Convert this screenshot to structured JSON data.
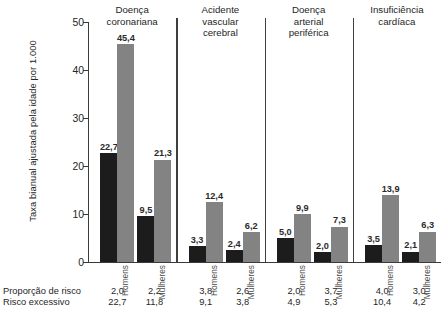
{
  "chart_data": {
    "type": "bar",
    "title": "",
    "xlabel": "",
    "ylabel": "Taxa bianual ajustada pela idade por 1.000",
    "ylim": [
      0,
      50
    ],
    "yticks": [
      0,
      10,
      20,
      30,
      40,
      50
    ],
    "ytick_labels": [
      "0",
      "10",
      "20",
      "30",
      "40",
      "50"
    ],
    "grid": false,
    "legend_position": "none",
    "group_titles": [
      "Doença\ncoronariana",
      "Acidente\nvascular\ncerebral",
      "Doença\narterial\nperiférica",
      "Insuficiência\ncardíaca"
    ],
    "categories": [
      "Homens",
      "Mulheres",
      "Homens",
      "Mulheres",
      "Homens",
      "Mulheres",
      "Homens",
      "Mulheres"
    ],
    "series": [
      {
        "name": "dark",
        "color": "#1c1c1c",
        "values": [
          22.7,
          9.5,
          3.3,
          2.4,
          5.0,
          2.0,
          3.5,
          2.1
        ],
        "labels": [
          "22,7",
          "9,5",
          "3,3",
          "2,4",
          "5,0",
          "2,0",
          "3,5",
          "2,1"
        ]
      },
      {
        "name": "gray",
        "color": "#838383",
        "values": [
          45.4,
          21.3,
          12.4,
          6.2,
          9.9,
          7.3,
          13.9,
          6.3
        ],
        "labels": [
          "45,4",
          "21,3",
          "12,4",
          "6,2",
          "9,9",
          "7,3",
          "13,9",
          "6,3"
        ]
      }
    ],
    "table": {
      "rows": [
        {
          "label": "Proporção de risco",
          "values": [
            "2,0",
            "2,2",
            "3,8",
            "2,6",
            "2,0",
            "3,7",
            "4,0",
            "3,0"
          ]
        },
        {
          "label": "Risco excessivo",
          "values": [
            "22,7",
            "11,8",
            "9,1",
            "3,8",
            "4,9",
            "5,3",
            "10,4",
            "4,2"
          ]
        }
      ]
    }
  }
}
